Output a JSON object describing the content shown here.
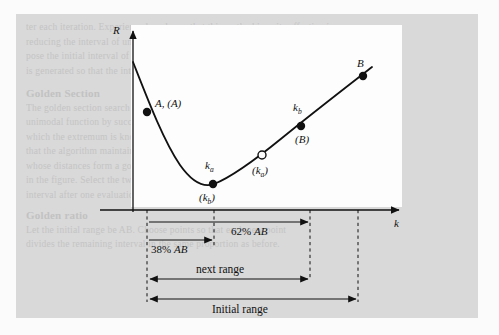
{
  "figure": {
    "type": "golden-section-search-diagram",
    "axes": {
      "y_label": "R",
      "x_label": "k"
    },
    "curve_points": [
      {
        "id": "A",
        "label_above": "A, (A)",
        "label_below": "",
        "marker": "filled",
        "x": 147,
        "y": 112
      },
      {
        "id": "ka",
        "label_above": "k",
        "label_above_sub": "a",
        "label_below": "(k",
        "label_below_sub": "b",
        "label_below_tail": ")",
        "marker": "filled",
        "x": 213,
        "y": 183
      },
      {
        "id": "kaO",
        "label_above": "",
        "label_below": "(k",
        "label_below_sub": "a",
        "label_below_tail": ")",
        "marker": "open",
        "x": 262,
        "y": 155
      },
      {
        "id": "kb",
        "label_above": "k",
        "label_above_sub": "b",
        "label_below": "(B)",
        "marker": "filled",
        "x": 301,
        "y": 126
      },
      {
        "id": "B",
        "label_above": "B",
        "label_below": "",
        "marker": "filled",
        "x": 363,
        "y": 75
      }
    ],
    "labels": {
      "point_a": "A, (A)",
      "point_ka_top": "k",
      "point_ka_top_sub": "a",
      "point_kb_paren": "(k",
      "point_kb_paren_sub": "b",
      "point_kb_paren_tail": ")",
      "open_point_paren": "(k",
      "open_point_paren_sub": "a",
      "open_point_paren_tail": ")",
      "point_kb_top": "k",
      "point_kb_top_sub": "b",
      "point_b_paren": "(B)",
      "point_b": "B"
    },
    "annotations": {
      "pct_left": "38%",
      "pct_left_ab": "AB",
      "pct_right": "62%",
      "pct_right_ab": "AB",
      "next_range": "next range",
      "initial_range": "Initial range"
    },
    "guides_x": [
      147,
      214,
      310,
      358
    ],
    "colors": {
      "plate": "#d9d9d9",
      "panel": "#fdfdfd",
      "ink": "#111111",
      "ghost": "#c0c0c0"
    }
  },
  "ghost": {
    "line1": "ter each iteration. Experience has shown that this method is quite effective in",
    "line2": "reducing the interval of uncertainty. The ratio of reduction is constant. Sup-",
    "line3": "pose the initial interval of uncertainty is known and a sequence of points",
    "line4": "is generated so that the interval shrinks by a fixed fraction at every step.",
    "head1": "Golden Section",
    "line5": "The golden section search is a technique for finding an extremum of a",
    "line6": "unimodal function by successively narrowing the range of values inside",
    "line7": "which the extremum is known to exist. The name derives from the fact",
    "line8": "that the algorithm maintains the function values for triples of points",
    "line9": "whose distances form a golden ratio. Consider the function R(k) shown",
    "line10": "in the figure. Select the two interior points so that the remaining",
    "line11": "interval after one evaluation is the same regardless of outcome.",
    "head2": "Golden ratio",
    "line12": "Let the initial range be AB. Choose points so that each new point",
    "line13": "divides the remaining interval in the same proportion as before."
  }
}
